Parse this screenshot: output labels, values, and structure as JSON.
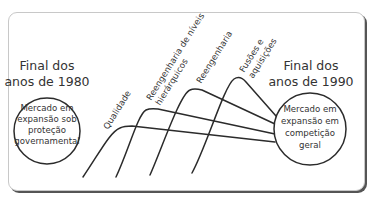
{
  "left": {
    "era_line1": "Final dos",
    "era_line2": "anos de 1980",
    "circle_line1": "Mercado em",
    "circle_line2": "expansão sob",
    "circle_line3": "proteção",
    "circle_line4": "governamental"
  },
  "right": {
    "era_line1": "Final dos",
    "era_line2": "anos de 1990",
    "circle_line1": "Mercado em",
    "circle_line2": "expansão em",
    "circle_line3": "competição",
    "circle_line4": "geral"
  },
  "waves": [
    {
      "line1": "Qualidade",
      "line2": ""
    },
    {
      "line1": "Reengenharia de níveis",
      "line2": "hierárquicos"
    },
    {
      "line1": "Reengenharia",
      "line2": ""
    },
    {
      "line1": "Fusões e",
      "line2": "aquisições"
    }
  ],
  "colors": {
    "line": "#2b2b2b",
    "text": "#333333",
    "card_border": "#c8c8c8",
    "card_shadow": "#555555"
  }
}
